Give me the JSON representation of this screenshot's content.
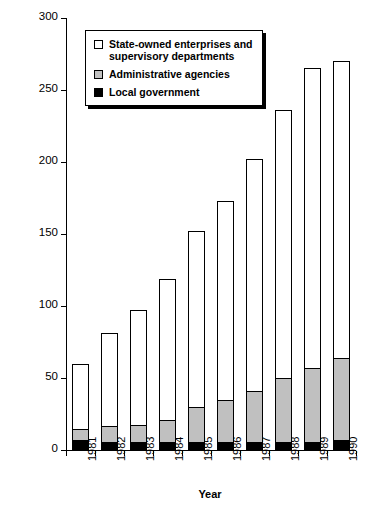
{
  "chart_data": {
    "type": "bar",
    "subtype": "stacked-bar",
    "title": "",
    "xlabel": "Year",
    "ylabel": "Extrabudgetary Funds (billion yuan)",
    "categories": [
      "1981",
      "1982",
      "1983",
      "1984",
      "1985",
      "1986",
      "1987",
      "1988",
      "1989",
      "1990"
    ],
    "series": [
      {
        "name": "Local government",
        "color": "#000000",
        "values": [
          6,
          5,
          5,
          5,
          5,
          5,
          5,
          5,
          5,
          6
        ]
      },
      {
        "name": "Administrative agencies",
        "color": "#c0c0c0",
        "values": [
          8,
          11,
          12,
          15,
          24,
          29,
          35,
          44,
          51,
          57
        ]
      },
      {
        "name": "State-owned enterprises and supervisory departments",
        "color": "#ffffff",
        "values": [
          46,
          65,
          80,
          99,
          123,
          139,
          162,
          187,
          209,
          207
        ]
      }
    ],
    "totals": [
      60,
      81,
      97,
      119,
      152,
      173,
      202,
      236,
      265,
      270
    ],
    "ylim": [
      0,
      300
    ],
    "yticks": [
      0,
      50,
      100,
      150,
      200,
      250,
      300
    ],
    "ytick_labels": [
      "0",
      "50",
      "100",
      "150",
      "200",
      "250",
      "300"
    ],
    "grid": false,
    "legend_position": "top-left",
    "legend_entries": [
      {
        "label_line1": "State-owned enterprises and",
        "label_line2": "supervisory departments",
        "swatch": "white"
      },
      {
        "label_line1": "Administrative agencies",
        "label_line2": "",
        "swatch": "gray"
      },
      {
        "label_line1": "Local government",
        "label_line2": "",
        "swatch": "black"
      }
    ]
  }
}
